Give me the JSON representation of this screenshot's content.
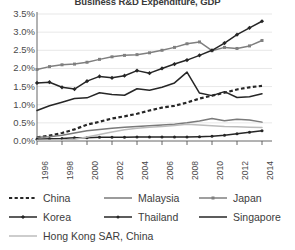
{
  "chart_data": {
    "type": "line",
    "title": "Business R&D Expenditure, GDP",
    "xlabel": "",
    "ylabel": "",
    "grid": true,
    "legend_position": "bottom",
    "ylim": [
      0.0,
      3.5
    ],
    "yticks": [
      "0.0%",
      "0.5%",
      "1.0%",
      "1.5%",
      "2.0%",
      "2.5%",
      "3.0%",
      "3.5%"
    ],
    "ytick_values": [
      0.0,
      0.5,
      1.0,
      1.5,
      2.0,
      2.5,
      3.0,
      3.5
    ],
    "x": [
      1996,
      1997,
      1998,
      1999,
      2000,
      2001,
      2002,
      2003,
      2004,
      2005,
      2006,
      2007,
      2008,
      2009,
      2010,
      2011,
      2012,
      2013,
      2014
    ],
    "xtick_labels": [
      "1996",
      "1998",
      "2000",
      "2002",
      "2004",
      "2006",
      "2008",
      "2010",
      "2012",
      "2014"
    ],
    "xtick_values": [
      1996,
      1998,
      2000,
      2002,
      2004,
      2006,
      2008,
      2010,
      2012,
      2014
    ],
    "series": [
      {
        "name": "China",
        "color": "#262626",
        "style": "dotted",
        "marker": "none",
        "values": [
          0.1,
          0.15,
          0.22,
          0.32,
          0.45,
          0.53,
          0.62,
          0.68,
          0.75,
          0.84,
          0.92,
          0.97,
          1.06,
          1.17,
          1.25,
          1.33,
          1.42,
          1.48,
          1.52
        ]
      },
      {
        "name": "Malaysia",
        "color": "#7a7a7a",
        "style": "solid",
        "marker": "none",
        "values": [
          0.1,
          0.12,
          0.16,
          0.22,
          0.28,
          0.32,
          0.35,
          0.38,
          0.4,
          0.42,
          0.44,
          0.46,
          0.5,
          0.55,
          0.62,
          0.56,
          0.6,
          0.58,
          0.52
        ]
      },
      {
        "name": "Japan",
        "color": "#7f7f7f",
        "style": "solid",
        "marker": "square",
        "values": [
          1.97,
          2.05,
          2.1,
          2.12,
          2.17,
          2.25,
          2.32,
          2.36,
          2.38,
          2.43,
          2.5,
          2.58,
          2.68,
          2.73,
          2.49,
          2.58,
          2.55,
          2.62,
          2.77
        ]
      },
      {
        "name": "Korea",
        "color": "#262626",
        "style": "solid",
        "marker": "diamond",
        "values": [
          1.6,
          1.62,
          1.48,
          1.43,
          1.65,
          1.78,
          1.74,
          1.8,
          1.94,
          1.87,
          2.0,
          2.12,
          2.23,
          2.36,
          2.5,
          2.7,
          2.93,
          3.12,
          3.3
        ]
      },
      {
        "name": "Thailand",
        "color": "#262626",
        "style": "solid",
        "marker": "dot",
        "values": [
          0.05,
          0.06,
          0.07,
          0.09,
          0.09,
          0.1,
          0.1,
          0.1,
          0.11,
          0.11,
          0.11,
          0.11,
          0.11,
          0.12,
          0.13,
          0.16,
          0.2,
          0.24,
          0.28
        ]
      },
      {
        "name": "Singapore",
        "color": "#262626",
        "style": "solid",
        "marker": "none",
        "values": [
          0.84,
          0.97,
          1.07,
          1.17,
          1.19,
          1.33,
          1.28,
          1.26,
          1.44,
          1.4,
          1.48,
          1.6,
          1.9,
          1.32,
          1.25,
          1.36,
          1.2,
          1.22,
          1.3
        ]
      },
      {
        "name": "Hong Kong SAR, China",
        "color": "#bcbcbc",
        "style": "solid",
        "marker": "none",
        "values": [
          0.02,
          0.02,
          0.03,
          0.05,
          0.11,
          0.18,
          0.25,
          0.31,
          0.35,
          0.38,
          0.4,
          0.43,
          0.46,
          0.44,
          0.42,
          0.4,
          0.39,
          0.38,
          0.37
        ]
      }
    ]
  },
  "legend": {
    "rows": [
      [
        {
          "name": "China",
          "style": "dotted",
          "marker": "none",
          "color": "#262626"
        },
        {
          "name": "Malaysia",
          "style": "solid",
          "marker": "none",
          "color": "#7a7a7a"
        },
        {
          "name": "Japan",
          "style": "solid",
          "marker": "square",
          "color": "#7f7f7f"
        }
      ],
      [
        {
          "name": "Korea",
          "style": "solid",
          "marker": "diamond",
          "color": "#262626"
        },
        {
          "name": "Thailand",
          "style": "solid",
          "marker": "dot",
          "color": "#262626"
        },
        {
          "name": "Singapore",
          "style": "solid",
          "marker": "none",
          "color": "#262626"
        }
      ],
      [
        {
          "name": "Hong Kong SAR, China",
          "style": "solid",
          "marker": "none",
          "color": "#bcbcbc"
        }
      ]
    ]
  },
  "axes": {
    "axis_color": "#555555",
    "grid_color": "#dcdcdc"
  }
}
